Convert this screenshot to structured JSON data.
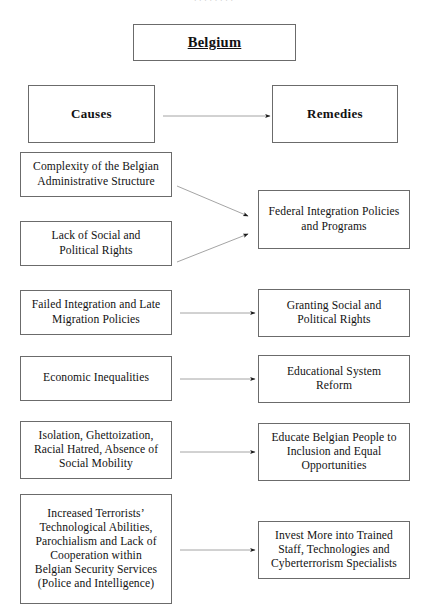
{
  "page": {
    "top_clipped_text": "· · · · · · · ·",
    "line_color": "#6b6b6b",
    "arrow_color": "#8a8a8a",
    "arrowhead_color": "#1a1a1a",
    "background": "#ffffff"
  },
  "title": {
    "label": "Belgium"
  },
  "columns": {
    "causes_header": "Causes",
    "remedies_header": "Remedies"
  },
  "causes": [
    {
      "label": "Complexity of the Belgian\nAdministrative Structure"
    },
    {
      "label": "Lack of Social and\nPolitical Rights"
    },
    {
      "label": "Failed Integration and Late\nMigration Policies"
    },
    {
      "label": "Economic Inequalities"
    },
    {
      "label": "Isolation, Ghettoization,\nRacial Hatred, Absence of\nSocial Mobility"
    },
    {
      "label": "Increased Terrorists’\nTechnological Abilities,\nParochialism and Lack of\nCooperation within\nBelgian Security Services\n(Police and Intelligence)"
    }
  ],
  "remedies": [
    {
      "label": "Federal Integration Policies\nand Programs"
    },
    {
      "label": "Granting Social and\nPolitical Rights"
    },
    {
      "label": "Educational System\nReform"
    },
    {
      "label": "Educate Belgian People to\nInclusion and Equal\nOpportunities"
    },
    {
      "label": "Invest More into Trained\nStaff, Technologies and\nCyberterrorism Specialists"
    }
  ],
  "connections": [
    {
      "name": "causes-to-remedies",
      "from": "Causes",
      "to": "Remedies"
    },
    {
      "name": "complexity-to-federal-integration",
      "from": "Complexity of the Belgian Administrative Structure",
      "to": "Federal Integration Policies and Programs"
    },
    {
      "name": "lack-of-rights-to-federal-integration",
      "from": "Lack of Social and Political Rights",
      "to": "Federal Integration Policies and Programs"
    },
    {
      "name": "failed-integration-to-granting-rights",
      "from": "Failed Integration and Late Migration Policies",
      "to": "Granting Social and Political Rights"
    },
    {
      "name": "economic-inequalities-to-educational-reform",
      "from": "Economic Inequalities",
      "to": "Educational System Reform"
    },
    {
      "name": "isolation-to-educate-belgian-people",
      "from": "Isolation, Ghettoization, Racial Hatred, Absence of Social Mobility",
      "to": "Educate Belgian People to Inclusion and Equal Opportunities"
    },
    {
      "name": "terrorists-abilities-to-invest-more",
      "from": "Increased Terrorists’ Technological Abilities, Parochialism and Lack of Cooperation within Belgian Security Services (Police and Intelligence)",
      "to": "Invest More into Trained Staff, Technologies and Cyberterrorism Specialists"
    }
  ]
}
